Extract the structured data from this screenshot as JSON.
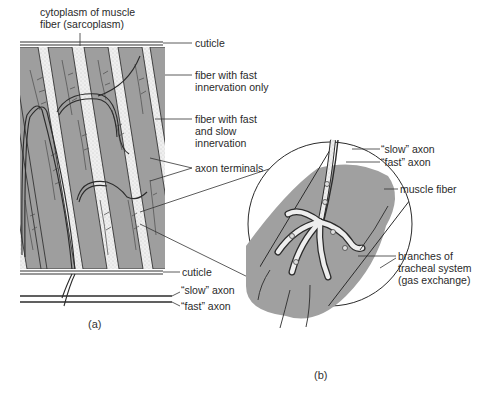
{
  "figure": {
    "panel_a": {
      "caption": "(a)",
      "labels": {
        "sarcoplasm": "cytoplasm of muscle\nfiber (sarcoplasm)",
        "cuticle_top": "cuticle",
        "fast_only": "fiber with fast\ninnervation only",
        "fast_slow": "fiber with fast\nand slow\ninnervation",
        "axon_terminals": "axon terminals",
        "cuticle_bottom": "cuticle",
        "slow_axon": "“slow” axon",
        "fast_axon": "“fast” axon"
      }
    },
    "panel_b": {
      "caption": "(b)",
      "labels": {
        "slow_axon": "“slow” axon",
        "fast_axon": "“fast” axon",
        "muscle_fiber": "muscle fiber",
        "tracheal": "branches of\ntracheal system\n(gas exchange)"
      }
    },
    "colors": {
      "fiber_fill": "#9e9e9e",
      "sarcoplasm_fill": "#ececec",
      "line": "#2b2b2b",
      "background": "#ffffff"
    }
  }
}
